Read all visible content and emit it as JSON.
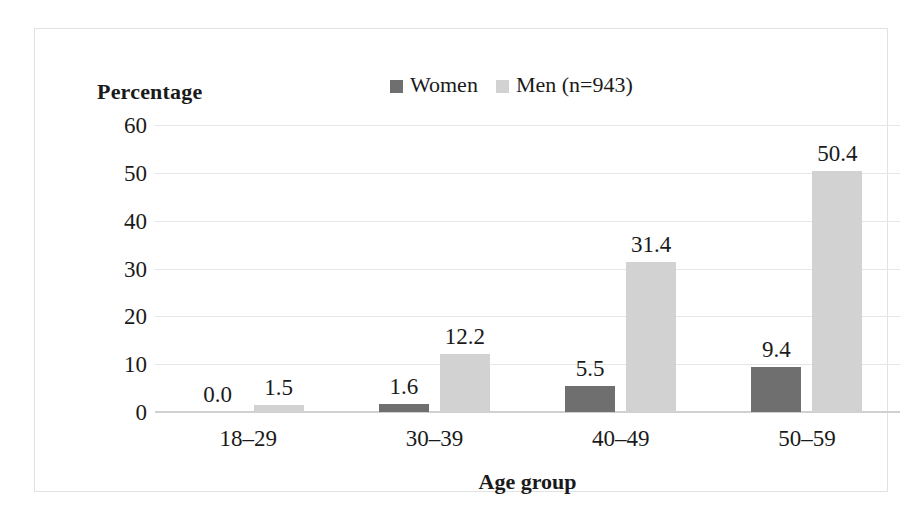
{
  "chart_data": {
    "type": "bar",
    "title": "",
    "xlabel": "Age group",
    "ylabel": "Percentage",
    "categories": [
      "18–29",
      "30–39",
      "40–49",
      "50–59"
    ],
    "series": [
      {
        "name": "Women",
        "color": "#6f6f6f",
        "values": [
          0.0,
          1.6,
          5.5,
          9.4
        ],
        "labels": [
          "0.0",
          "1.6",
          "5.5",
          "9.4"
        ]
      },
      {
        "name": "Men (n=943)",
        "color": "#d2d2d2",
        "values": [
          1.5,
          12.2,
          31.4,
          50.4
        ],
        "labels": [
          "1.5",
          "12.2",
          "31.4",
          "50.4"
        ]
      }
    ],
    "ylim": [
      0,
      60
    ],
    "yticks": [
      "60",
      "50",
      "40",
      "30",
      "20",
      "10",
      "0"
    ],
    "ytick_values": [
      60,
      50,
      40,
      30,
      20,
      10,
      0
    ],
    "grid": true,
    "legend_position": "top-center",
    "gridline_color": "#e6e6e6",
    "frame_color": "#e2e2e2",
    "background": "#ffffff"
  },
  "legend": {
    "entries": [
      {
        "label": "Women",
        "swatch": "legend-swatch-women"
      },
      {
        "label": "Men (n=943)",
        "swatch": "legend-swatch-men"
      }
    ]
  },
  "axes": {
    "y_title": "Percentage",
    "x_title": "Age group"
  }
}
